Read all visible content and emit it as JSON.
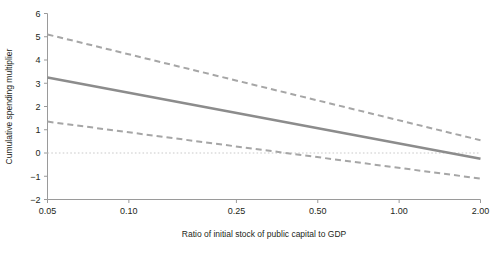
{
  "chart_data": {
    "type": "line",
    "title": "",
    "xlabel": "Ratio of initial stock of public capital to GDP",
    "ylabel": "Cumulative spending multiplier",
    "xscale": "log",
    "xlim": [
      0.05,
      2.0
    ],
    "ylim": [
      -2,
      6
    ],
    "grid": false,
    "legend": "none",
    "xticks": [
      0.05,
      0.1,
      0.25,
      0.5,
      1.0,
      2.0
    ],
    "xticklabels": [
      "0.05",
      "0.10",
      "0.25",
      "0.50",
      "1.00",
      "2.00"
    ],
    "yticks": [
      -2,
      -1,
      0,
      1,
      2,
      3,
      4,
      5,
      6
    ],
    "yticklabels": [
      "−2",
      "−1",
      "0",
      "1",
      "2",
      "3",
      "4",
      "5",
      "6"
    ],
    "annotations": [
      {
        "kind": "zero-reference-line",
        "y": 0,
        "style": "dotted"
      }
    ],
    "series": [
      {
        "name": "Point estimate",
        "style": "solid",
        "color": "#8c8c8c",
        "width": 2.6,
        "x": [
          0.05,
          2.0
        ],
        "values": [
          3.25,
          -0.25
        ]
      },
      {
        "name": "Upper confidence band",
        "style": "dashed",
        "color": "#a6a6a6",
        "width": 2.0,
        "x": [
          0.05,
          2.0
        ],
        "values": [
          5.1,
          0.55
        ]
      },
      {
        "name": "Lower confidence band",
        "style": "dashed",
        "color": "#a6a6a6",
        "width": 2.0,
        "x": [
          0.05,
          2.0
        ],
        "values": [
          1.35,
          -1.1
        ]
      }
    ]
  },
  "figure": {
    "background": "#ffffff",
    "axis_color": "#9a9a9a",
    "text_color": "#231f20",
    "zero_line_color": "#c9c9c9"
  }
}
